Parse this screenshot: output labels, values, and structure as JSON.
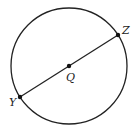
{
  "diagram": {
    "type": "circle-with-diameter",
    "circle": {
      "cx": 69,
      "cy": 66,
      "r": 58,
      "stroke": "#222222"
    },
    "points": [
      {
        "name": "Y",
        "x": 20,
        "y": 97,
        "label": "Y",
        "lx": 9,
        "ly": 106
      },
      {
        "name": "Q",
        "x": 69,
        "y": 66,
        "label": "Q",
        "lx": 66,
        "ly": 81
      },
      {
        "name": "Z",
        "x": 118,
        "y": 35,
        "label": "Z",
        "lx": 122,
        "ly": 34
      }
    ],
    "segment": {
      "from": "Y",
      "to": "Z"
    }
  }
}
